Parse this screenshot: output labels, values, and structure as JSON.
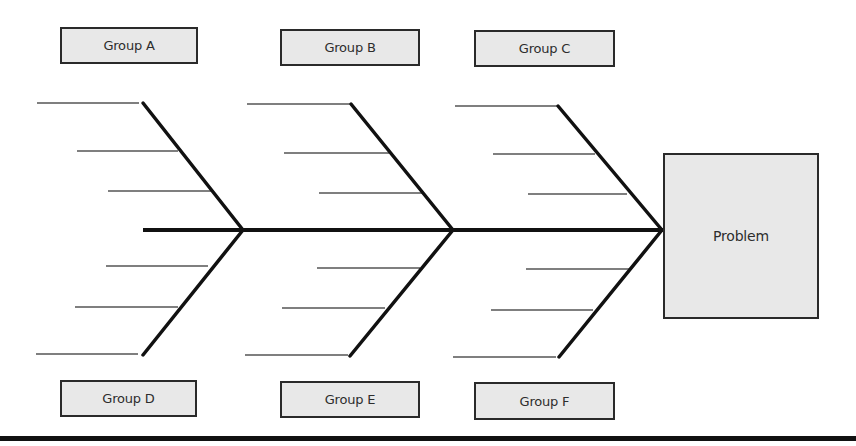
{
  "diagram": {
    "type": "fishbone",
    "head": {
      "label": "Problem",
      "box": {
        "x": 663,
        "y": 153,
        "w": 156,
        "h": 166
      }
    },
    "spine": {
      "x1": 143,
      "y1": 230,
      "x2": 663,
      "y2": 230
    },
    "groups": [
      {
        "id": "A",
        "label": "Group A",
        "position": "top",
        "box": {
          "x": 60,
          "y": 27,
          "w": 138,
          "h": 37
        }
      },
      {
        "id": "B",
        "label": "Group B",
        "position": "top",
        "box": {
          "x": 280,
          "y": 29,
          "w": 140,
          "h": 37
        }
      },
      {
        "id": "C",
        "label": "Group C",
        "position": "top",
        "box": {
          "x": 474,
          "y": 30,
          "w": 141,
          "h": 37
        }
      },
      {
        "id": "D",
        "label": "Group D",
        "position": "bottom",
        "box": {
          "x": 60,
          "y": 380,
          "w": 137,
          "h": 37
        }
      },
      {
        "id": "E",
        "label": "Group E",
        "position": "bottom",
        "box": {
          "x": 280,
          "y": 381,
          "w": 140,
          "h": 37
        }
      },
      {
        "id": "F",
        "label": "Group F",
        "position": "bottom",
        "box": {
          "x": 474,
          "y": 382,
          "w": 141,
          "h": 38
        }
      }
    ],
    "bones": [
      {
        "group": "A",
        "x1": 143,
        "y1": 103,
        "x2": 243,
        "y2": 230
      },
      {
        "group": "D",
        "x1": 143,
        "y1": 355,
        "x2": 243,
        "y2": 230
      },
      {
        "group": "B",
        "x1": 351,
        "y1": 104,
        "x2": 453,
        "y2": 230
      },
      {
        "group": "E",
        "x1": 350,
        "y1": 356,
        "x2": 453,
        "y2": 230
      },
      {
        "group": "C",
        "x1": 558,
        "y1": 106,
        "x2": 662,
        "y2": 230
      },
      {
        "group": "F",
        "x1": 559,
        "y1": 357,
        "x2": 662,
        "y2": 230
      }
    ],
    "ribs": [
      {
        "group": "A",
        "x1": 37,
        "x2": 139,
        "y": 103
      },
      {
        "group": "A",
        "x1": 77,
        "x2": 178,
        "y": 151
      },
      {
        "group": "A",
        "x1": 108,
        "x2": 211,
        "y": 191
      },
      {
        "group": "D",
        "x1": 106,
        "x2": 208,
        "y": 266
      },
      {
        "group": "D",
        "x1": 75,
        "x2": 178,
        "y": 307
      },
      {
        "group": "D",
        "x1": 36,
        "x2": 138,
        "y": 354
      },
      {
        "group": "B",
        "x1": 247,
        "x2": 350,
        "y": 104
      },
      {
        "group": "B",
        "x1": 284,
        "x2": 389,
        "y": 153
      },
      {
        "group": "B",
        "x1": 319,
        "x2": 422,
        "y": 193
      },
      {
        "group": "E",
        "x1": 317,
        "x2": 420,
        "y": 268
      },
      {
        "group": "E",
        "x1": 282,
        "x2": 385,
        "y": 308
      },
      {
        "group": "E",
        "x1": 245,
        "x2": 348,
        "y": 355
      },
      {
        "group": "C",
        "x1": 455,
        "x2": 558,
        "y": 106
      },
      {
        "group": "C",
        "x1": 493,
        "x2": 595,
        "y": 154
      },
      {
        "group": "C",
        "x1": 528,
        "x2": 627,
        "y": 194
      },
      {
        "group": "F",
        "x1": 526,
        "x2": 630,
        "y": 269
      },
      {
        "group": "F",
        "x1": 491,
        "x2": 593,
        "y": 310
      },
      {
        "group": "F",
        "x1": 453,
        "x2": 556,
        "y": 357
      }
    ],
    "colors": {
      "box_fill": "#e8e8e8",
      "box_border": "#2a2a2a",
      "bone": "#111111",
      "rib": "#555555",
      "text": "#2d2d2d"
    }
  }
}
